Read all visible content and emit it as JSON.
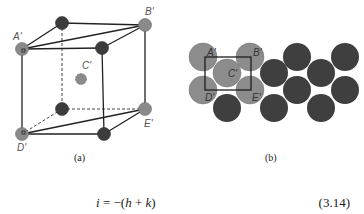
{
  "figure_a": {
    "caption": "(a)",
    "labels": {
      "A": "A'",
      "B": "B'",
      "C": "C'",
      "D": "D'",
      "E": "E'"
    },
    "colors": {
      "gray_atom": "#8a8a8a",
      "dark_atom": "#3c3c3c",
      "edge": "#222222"
    }
  },
  "figure_b": {
    "caption": "(b)",
    "labels": {
      "A": "A'",
      "B": "B'",
      "C": "C'",
      "D": "D'",
      "E": "E'"
    },
    "colors": {
      "gray_atom": "#8c8c8c",
      "dark_atom": "#3f3f3f",
      "box": "#1e1e1e"
    }
  },
  "equation": {
    "lhs": "i",
    "equals": " = −(",
    "h": "h",
    "plus": " + ",
    "k": "k",
    "close": ")",
    "number": "(3.14)"
  }
}
